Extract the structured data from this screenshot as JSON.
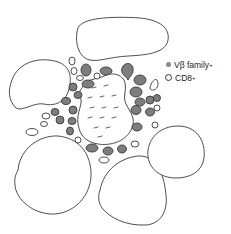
{
  "diagram": {
    "colors": {
      "vb_family_fill": "#7d7d7d",
      "cd8_fill": "#ffffff",
      "outline": "#3a3a3a",
      "background": "#ffffff"
    }
  },
  "legend": {
    "items": [
      {
        "icon": "gray-filled-circle",
        "label": "Vβ family",
        "superscript": "+"
      },
      {
        "icon": "open-circle",
        "label": "CD8",
        "superscript": "+"
      }
    ]
  }
}
